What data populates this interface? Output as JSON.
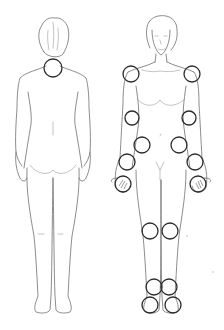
{
  "diagram": {
    "title": "",
    "views": [
      {
        "id": "back",
        "label": "",
        "marked_joints": [
          {
            "name": "neck",
            "cx": 53,
            "cy": 68,
            "r": 9
          }
        ]
      },
      {
        "id": "front",
        "label": "",
        "marked_joints": [
          {
            "name": "left-shoulder",
            "cx": 131,
            "cy": 74,
            "r": 8
          },
          {
            "name": "right-shoulder",
            "cx": 192,
            "cy": 74,
            "r": 8
          },
          {
            "name": "left-elbow",
            "cx": 132,
            "cy": 118,
            "r": 7
          },
          {
            "name": "right-elbow",
            "cx": 189,
            "cy": 118,
            "r": 7
          },
          {
            "name": "left-hip",
            "cx": 142,
            "cy": 145,
            "r": 8
          },
          {
            "name": "right-hip",
            "cx": 179,
            "cy": 145,
            "r": 8
          },
          {
            "name": "left-wrist",
            "cx": 127,
            "cy": 162,
            "r": 8
          },
          {
            "name": "right-wrist",
            "cx": 195,
            "cy": 162,
            "r": 8
          },
          {
            "name": "left-hand",
            "cx": 123,
            "cy": 184,
            "r": 8
          },
          {
            "name": "right-hand",
            "cx": 198,
            "cy": 184,
            "r": 8
          },
          {
            "name": "left-knee",
            "cx": 150,
            "cy": 231,
            "r": 8
          },
          {
            "name": "right-knee",
            "cx": 170,
            "cy": 231,
            "r": 8
          },
          {
            "name": "left-ankle",
            "cx": 154,
            "cy": 287,
            "r": 8
          },
          {
            "name": "right-ankle",
            "cx": 169,
            "cy": 287,
            "r": 8
          },
          {
            "name": "left-foot",
            "cx": 150,
            "cy": 305,
            "r": 8
          },
          {
            "name": "right-foot",
            "cx": 173,
            "cy": 305,
            "r": 8
          }
        ]
      }
    ],
    "colors": {
      "background": "#ffffff",
      "outline": "#6f6f6f",
      "joint_marker": "#2b2b2b"
    }
  }
}
